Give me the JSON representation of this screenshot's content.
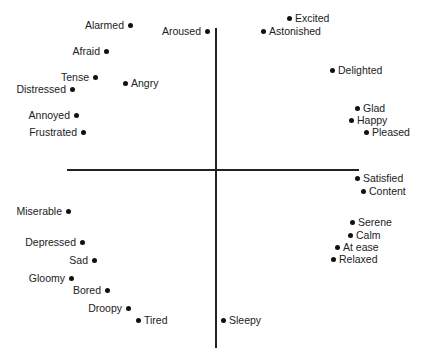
{
  "diagram": {
    "title": "",
    "axes": {
      "horizontal": {
        "x1": 67,
        "x2": 359,
        "y": 170
      },
      "vertical": {
        "x": 216,
        "y1": 28,
        "y2": 348
      }
    },
    "points": [
      {
        "label": "Alarmed",
        "x": 130,
        "y": 25,
        "side": "left"
      },
      {
        "label": "Aroused",
        "x": 207,
        "y": 31,
        "side": "left"
      },
      {
        "label": "Excited",
        "x": 289,
        "y": 18,
        "side": "right"
      },
      {
        "label": "Astonished",
        "x": 263,
        "y": 31,
        "side": "right"
      },
      {
        "label": "Afraid",
        "x": 106,
        "y": 51,
        "side": "left"
      },
      {
        "label": "Delighted",
        "x": 332,
        "y": 70,
        "side": "right"
      },
      {
        "label": "Tense",
        "x": 95,
        "y": 77,
        "side": "left"
      },
      {
        "label": "Angry",
        "x": 125,
        "y": 83,
        "side": "right"
      },
      {
        "label": "Distressed",
        "x": 72,
        "y": 89,
        "side": "left"
      },
      {
        "label": "Glad",
        "x": 357,
        "y": 108,
        "side": "right"
      },
      {
        "label": "Annoyed",
        "x": 76,
        "y": 115,
        "side": "left"
      },
      {
        "label": "Happy",
        "x": 351,
        "y": 120,
        "side": "right"
      },
      {
        "label": "Frustrated",
        "x": 83,
        "y": 132,
        "side": "left"
      },
      {
        "label": "Pleased",
        "x": 366,
        "y": 132,
        "side": "right"
      },
      {
        "label": "Satisfied",
        "x": 357,
        "y": 178,
        "side": "right"
      },
      {
        "label": "Content",
        "x": 363,
        "y": 191,
        "side": "right"
      },
      {
        "label": "Miserable",
        "x": 68,
        "y": 211,
        "side": "left"
      },
      {
        "label": "Serene",
        "x": 352,
        "y": 222,
        "side": "right"
      },
      {
        "label": "Calm",
        "x": 350,
        "y": 235,
        "side": "right"
      },
      {
        "label": "Depressed",
        "x": 82,
        "y": 242,
        "side": "left"
      },
      {
        "label": "At ease",
        "x": 337,
        "y": 247,
        "side": "right"
      },
      {
        "label": "Relaxed",
        "x": 333,
        "y": 259,
        "side": "right"
      },
      {
        "label": "Sad",
        "x": 94,
        "y": 260,
        "side": "left"
      },
      {
        "label": "Gloomy",
        "x": 71,
        "y": 278,
        "side": "left"
      },
      {
        "label": "Bored",
        "x": 107,
        "y": 290,
        "side": "left"
      },
      {
        "label": "Droopy",
        "x": 128,
        "y": 308,
        "side": "left"
      },
      {
        "label": "Tired",
        "x": 138,
        "y": 320,
        "side": "right"
      },
      {
        "label": "Sleepy",
        "x": 223,
        "y": 320,
        "side": "right"
      }
    ]
  }
}
